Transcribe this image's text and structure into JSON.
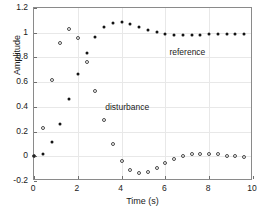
{
  "chart_data": {
    "type": "scatter",
    "title": "",
    "xlabel": "Time (s)",
    "ylabel": "Amplitude",
    "xlim": [
      0,
      10
    ],
    "ylim": [
      -0.2,
      1.2
    ],
    "xticks": [
      0,
      2,
      4,
      6,
      8,
      10
    ],
    "xticklabels": [
      "0",
      "2",
      "4",
      "6",
      "8",
      "10"
    ],
    "yticks": [
      -0.2,
      0,
      0.2,
      0.4,
      0.6,
      0.8,
      1,
      1.2
    ],
    "yticklabels": [
      "-0.2",
      "0",
      "0.2",
      "0.4",
      "0.6",
      "0.8",
      "1",
      "1.2"
    ],
    "grid": true,
    "legend_position": "inline-annotations",
    "series": [
      {
        "name": "reference",
        "marker": "filled-circle",
        "color": "#141414",
        "annotation": "reference",
        "annotation_x": 7.05,
        "annotation_y": 0.875,
        "x": [
          0.0,
          0.4,
          0.8,
          1.2,
          1.6,
          2.0,
          2.4,
          2.8,
          3.2,
          3.6,
          4.0,
          4.4,
          4.8,
          5.2,
          5.6,
          6.0,
          6.4,
          6.8,
          7.2,
          7.6,
          8.0,
          8.4,
          8.8,
          9.2,
          9.6
        ],
        "y": [
          0.0,
          0.02,
          0.115,
          0.265,
          0.465,
          0.665,
          0.835,
          0.965,
          1.045,
          1.08,
          1.085,
          1.07,
          1.045,
          1.025,
          1.005,
          0.99,
          0.985,
          0.985,
          0.985,
          0.985,
          0.99,
          0.99,
          0.99,
          0.99,
          0.99
        ]
      },
      {
        "name": "disturbance",
        "marker": "open-circle",
        "color": "#4a4a4a",
        "annotation": "disturbance",
        "annotation_x": 4.3,
        "annotation_y": 0.435,
        "x": [
          0.0,
          0.4,
          0.8,
          1.2,
          1.6,
          2.0,
          2.4,
          2.8,
          3.2,
          3.6,
          4.0,
          4.4,
          4.8,
          5.2,
          5.6,
          6.0,
          6.4,
          6.8,
          7.2,
          7.6,
          8.0,
          8.4,
          8.8,
          9.2,
          9.6
        ],
        "y": [
          0.0,
          0.225,
          0.62,
          0.915,
          1.03,
          0.955,
          0.765,
          0.53,
          0.29,
          0.1,
          -0.04,
          -0.115,
          -0.135,
          -0.125,
          -0.095,
          -0.055,
          -0.02,
          0.005,
          0.015,
          0.02,
          0.02,
          0.015,
          0.005,
          0.0,
          -0.005
        ]
      }
    ]
  }
}
